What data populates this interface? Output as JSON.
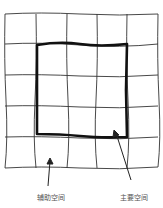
{
  "diagram": {
    "grid": {
      "columns": 5,
      "rows": 5,
      "x0": 5,
      "y0": 14,
      "x1": 158,
      "y1": 168
    },
    "main_square": {
      "col_start": 1,
      "col_end": 4,
      "row_start": 1,
      "row_end": 4
    },
    "labels": {
      "auxiliary": "辅助空间",
      "main": "主要空间"
    },
    "colors": {
      "line": "#222222",
      "thick": "#111111",
      "text": "#555555"
    }
  }
}
